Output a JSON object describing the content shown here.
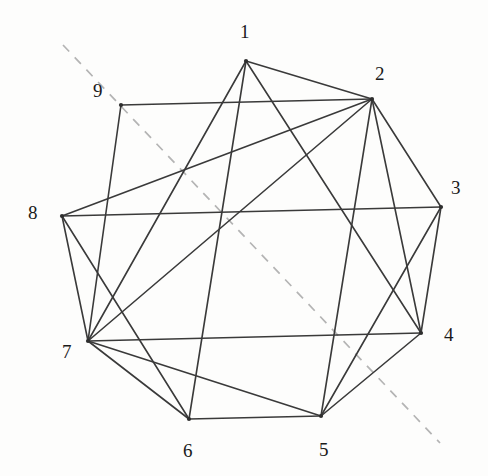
{
  "diagram": {
    "kind": "hand-drawn-graph",
    "title": "",
    "canvas": {
      "width": 488,
      "height": 476,
      "background": "#fdfdfc"
    },
    "style": {
      "edge_color": "#3a3a3a",
      "edge_width": 1.6,
      "dashed_color": "#b4b4b4",
      "dashed_width": 1.7,
      "dash_pattern": "9 8",
      "label_color": "#1a1a1a",
      "label_font_size": 19,
      "vertex_dot_color": "#2e2e2e",
      "vertex_dot_radius": 2.1
    },
    "vertices": [
      {
        "id": "1",
        "label": "1",
        "x": 246,
        "y": 61,
        "label_x": 240,
        "label_y": 22
      },
      {
        "id": "2",
        "label": "2",
        "x": 372,
        "y": 99,
        "label_x": 375,
        "label_y": 64
      },
      {
        "id": "3",
        "label": "3",
        "x": 441,
        "y": 207,
        "label_x": 451,
        "label_y": 178
      },
      {
        "id": "4",
        "label": "4",
        "x": 421,
        "y": 333,
        "label_x": 444,
        "label_y": 325
      },
      {
        "id": "5",
        "label": "5",
        "x": 321,
        "y": 416,
        "label_x": 319,
        "label_y": 440
      },
      {
        "id": "6",
        "label": "6",
        "x": 189,
        "y": 419,
        "label_x": 183,
        "label_y": 441
      },
      {
        "id": "7",
        "label": "7",
        "x": 88,
        "y": 341,
        "label_x": 62,
        "label_y": 342
      },
      {
        "id": "8",
        "label": "8",
        "x": 62,
        "y": 216,
        "label_x": 28,
        "label_y": 203
      },
      {
        "id": "9",
        "label": "9",
        "x": 121,
        "y": 105,
        "label_x": 93,
        "label_y": 81
      }
    ],
    "edges": [
      {
        "from": "9",
        "to": "2"
      },
      {
        "from": "9",
        "to": "7"
      },
      {
        "from": "1",
        "to": "2"
      },
      {
        "from": "1",
        "to": "7"
      },
      {
        "from": "1",
        "to": "6"
      },
      {
        "from": "1",
        "to": "4"
      },
      {
        "from": "2",
        "to": "3"
      },
      {
        "from": "2",
        "to": "4"
      },
      {
        "from": "2",
        "to": "5"
      },
      {
        "from": "2",
        "to": "7"
      },
      {
        "from": "2",
        "to": "8"
      },
      {
        "from": "3",
        "to": "4"
      },
      {
        "from": "3",
        "to": "8"
      },
      {
        "from": "3",
        "to": "5"
      },
      {
        "from": "4",
        "to": "5"
      },
      {
        "from": "4",
        "to": "7"
      },
      {
        "from": "5",
        "to": "6"
      },
      {
        "from": "5",
        "to": "7"
      },
      {
        "from": "6",
        "to": "7"
      },
      {
        "from": "6",
        "to": "8"
      },
      {
        "from": "7",
        "to": "8"
      }
    ],
    "dashed_lines": [
      {
        "name": "symmetry-axis",
        "x1": 63,
        "y1": 45,
        "x2": 440,
        "y2": 443
      }
    ]
  }
}
